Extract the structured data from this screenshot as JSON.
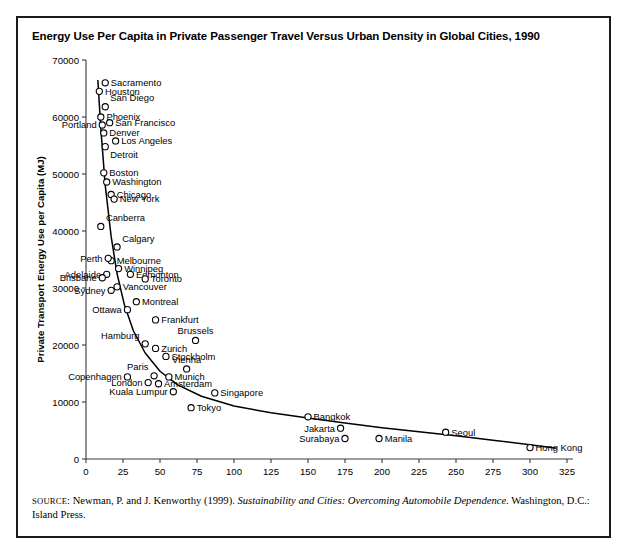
{
  "figure": {
    "title": "Energy Use Per Capita in Private Passenger Travel Versus Urban Density in Global Cities, 1990",
    "source_prefix": "SOURCE",
    "source_text_1": ": Newman, P. and J. Kenworthy (1999). ",
    "source_italic": "Sustainability and Cities: Overcoming Automobile Dependence",
    "source_text_2": ". Washington, D.C.: Island Press.",
    "border_color": "#1a1a1a",
    "marker_color": "#000000",
    "curve_color": "#000000"
  },
  "chart_data": {
    "type": "scatter",
    "title": "Energy Use Per Capita in Private Passenger Travel Versus Urban Density in Global Cities, 1990",
    "xlabel": "Urban Density (person/ha)",
    "ylabel": "Private Transport Energy Use per Capita (MJ)",
    "xlim": [
      0,
      325
    ],
    "ylim": [
      0,
      70000
    ],
    "xticks": [
      0,
      25,
      50,
      75,
      100,
      125,
      150,
      175,
      200,
      225,
      250,
      275,
      300,
      325
    ],
    "yticks": [
      0,
      10000,
      20000,
      30000,
      40000,
      50000,
      60000,
      70000
    ],
    "grid": false,
    "legend": null,
    "has_fitted_curve": true,
    "fitted_curve_note": "Descending power-law trend line through the points",
    "points": [
      {
        "label": "Sacramento",
        "x": 13,
        "y": 66000,
        "label_pos": "right"
      },
      {
        "label": "Houston",
        "x": 9,
        "y": 64500,
        "label_pos": "right"
      },
      {
        "label": "San Diego",
        "x": 13,
        "y": 61800,
        "label_pos": "above-right"
      },
      {
        "label": "Phoenix",
        "x": 10,
        "y": 60000,
        "label_pos": "right"
      },
      {
        "label": "San Francisco",
        "x": 16,
        "y": 59000,
        "label_pos": "right"
      },
      {
        "label": "Portland",
        "x": 11,
        "y": 58600,
        "label_pos": "left"
      },
      {
        "label": "Denver",
        "x": 12,
        "y": 57200,
        "label_pos": "right"
      },
      {
        "label": "Los Angeles",
        "x": 20,
        "y": 55800,
        "label_pos": "right"
      },
      {
        "label": "Detroit",
        "x": 13,
        "y": 54800,
        "label_pos": "below-right"
      },
      {
        "label": "Boston",
        "x": 12,
        "y": 50200,
        "label_pos": "right"
      },
      {
        "label": "Washington",
        "x": 14,
        "y": 48600,
        "label_pos": "right"
      },
      {
        "label": "Chicago",
        "x": 17,
        "y": 46400,
        "label_pos": "right"
      },
      {
        "label": "New York",
        "x": 19,
        "y": 45600,
        "label_pos": "right"
      },
      {
        "label": "Canberra",
        "x": 10,
        "y": 40800,
        "label_pos": "above-right"
      },
      {
        "label": "Calgary",
        "x": 21,
        "y": 37200,
        "label_pos": "above-right"
      },
      {
        "label": "Melbourne",
        "x": 17,
        "y": 34800,
        "label_pos": "right"
      },
      {
        "label": "Perth",
        "x": 15,
        "y": 35200,
        "label_pos": "left"
      },
      {
        "label": "Winnipeg",
        "x": 22,
        "y": 33400,
        "label_pos": "right"
      },
      {
        "label": "Adelaide",
        "x": 14,
        "y": 32400,
        "label_pos": "left"
      },
      {
        "label": "Edmonton",
        "x": 30,
        "y": 32400,
        "label_pos": "right"
      },
      {
        "label": "Brisbane",
        "x": 11,
        "y": 31800,
        "label_pos": "left"
      },
      {
        "label": "Toronto",
        "x": 40,
        "y": 31600,
        "label_pos": "right"
      },
      {
        "label": "Vancouver",
        "x": 21,
        "y": 30200,
        "label_pos": "right"
      },
      {
        "label": "Sydney",
        "x": 17,
        "y": 29600,
        "label_pos": "left"
      },
      {
        "label": "Montreal",
        "x": 34,
        "y": 27600,
        "label_pos": "right"
      },
      {
        "label": "Ottawa",
        "x": 28,
        "y": 26200,
        "label_pos": "left"
      },
      {
        "label": "Frankfurt",
        "x": 47,
        "y": 24400,
        "label_pos": "right"
      },
      {
        "label": "Brussels",
        "x": 74,
        "y": 20800,
        "label_pos": "above"
      },
      {
        "label": "Hamburg",
        "x": 40,
        "y": 20200,
        "label_pos": "above-left"
      },
      {
        "label": "Zurich",
        "x": 47,
        "y": 19400,
        "label_pos": "right"
      },
      {
        "label": "Stockholm",
        "x": 54,
        "y": 18000,
        "label_pos": "right"
      },
      {
        "label": "Vienna",
        "x": 68,
        "y": 15800,
        "label_pos": "above"
      },
      {
        "label": "Paris",
        "x": 46,
        "y": 14600,
        "label_pos": "above-left"
      },
      {
        "label": "Copenhagen",
        "x": 28,
        "y": 14400,
        "label_pos": "left"
      },
      {
        "label": "Munich",
        "x": 56,
        "y": 14400,
        "label_pos": "right"
      },
      {
        "label": "London",
        "x": 42,
        "y": 13400,
        "label_pos": "left"
      },
      {
        "label": "Amsterdam",
        "x": 49,
        "y": 13200,
        "label_pos": "right"
      },
      {
        "label": "Kuala Lumpur",
        "x": 59,
        "y": 11800,
        "label_pos": "left"
      },
      {
        "label": "Singapore",
        "x": 87,
        "y": 11600,
        "label_pos": "right"
      },
      {
        "label": "Tokyo",
        "x": 71,
        "y": 9000,
        "label_pos": "right"
      },
      {
        "label": "Bangkok",
        "x": 150,
        "y": 7400,
        "label_pos": "right"
      },
      {
        "label": "Jakarta",
        "x": 172,
        "y": 5400,
        "label_pos": "left"
      },
      {
        "label": "Surabaya",
        "x": 175,
        "y": 3600,
        "label_pos": "left"
      },
      {
        "label": "Manila",
        "x": 198,
        "y": 3600,
        "label_pos": "right"
      },
      {
        "label": "Seoul",
        "x": 243,
        "y": 4700,
        "label_pos": "right"
      },
      {
        "label": "Hong Kong",
        "x": 300,
        "y": 2000,
        "label_pos": "right"
      }
    ],
    "curve": [
      {
        "x": 8,
        "y": 66500
      },
      {
        "x": 10,
        "y": 58000
      },
      {
        "x": 13,
        "y": 48000
      },
      {
        "x": 17,
        "y": 39000
      },
      {
        "x": 21,
        "y": 32500
      },
      {
        "x": 26,
        "y": 27000
      },
      {
        "x": 32,
        "y": 22500
      },
      {
        "x": 40,
        "y": 18600
      },
      {
        "x": 50,
        "y": 15400
      },
      {
        "x": 62,
        "y": 13000
      },
      {
        "x": 78,
        "y": 11000
      },
      {
        "x": 100,
        "y": 9300
      },
      {
        "x": 125,
        "y": 8100
      },
      {
        "x": 150,
        "y": 7200
      },
      {
        "x": 175,
        "y": 6300
      },
      {
        "x": 200,
        "y": 5500
      },
      {
        "x": 225,
        "y": 4800
      },
      {
        "x": 250,
        "y": 4100
      },
      {
        "x": 275,
        "y": 3300
      },
      {
        "x": 300,
        "y": 2500
      },
      {
        "x": 318,
        "y": 1900
      }
    ]
  }
}
